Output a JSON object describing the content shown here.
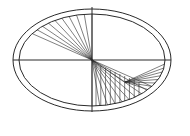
{
  "diagram": {
    "type": "ellipse-string-art",
    "stroke_color": "#2a2a2a",
    "background": "#ffffff",
    "center": [
      92,
      60
    ],
    "outer_ellipse": {
      "rx": 79,
      "ry": 51
    },
    "inner_ellipse": {
      "rx": 73,
      "ry": 46
    },
    "axes": {
      "horizontal": [
        13,
        171
      ],
      "vertical": [
        7,
        112
      ]
    },
    "fans": [
      {
        "name": "upper-left-fan",
        "from": [
          92,
          60
        ],
        "angles_deg_start": 90,
        "angles_deg_end": 145,
        "count": 10
      },
      {
        "name": "lower-center-fan",
        "from": [
          92,
          60
        ],
        "to_path_point": [
          125,
          82
        ],
        "count": 10
      },
      {
        "name": "lower-right-fan",
        "from": [
          125,
          82
        ],
        "angles_deg_start": -5,
        "angles_deg_end": -40,
        "count": 8
      }
    ]
  }
}
